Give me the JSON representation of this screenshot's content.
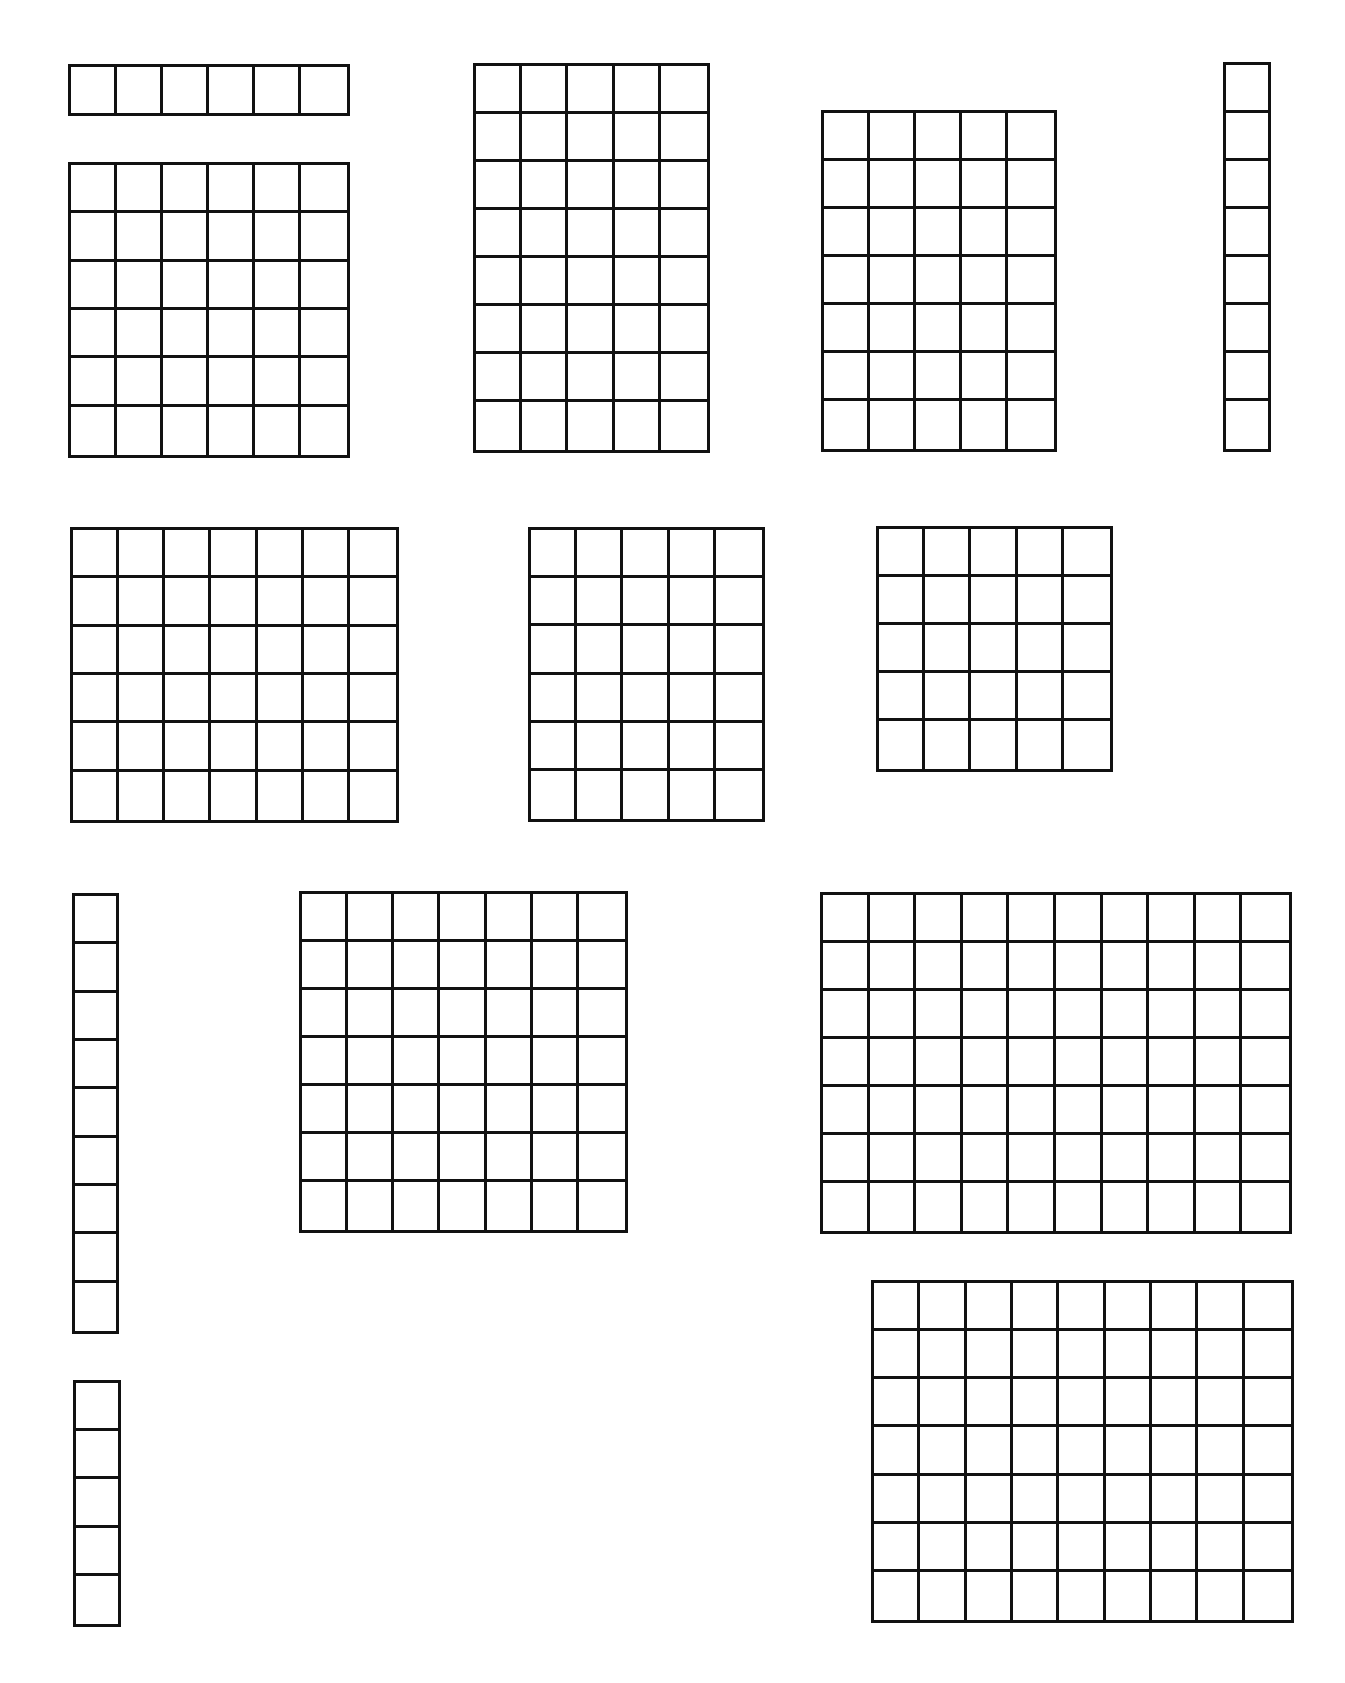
{
  "page": {
    "title": "",
    "background": "#ffffff",
    "line_color": "#111111",
    "line_width_px": 3,
    "cell_size_px": 48
  },
  "arrays": [
    {
      "id": "array-1",
      "rows": 1,
      "cols": 6,
      "x": 68,
      "y": 64,
      "w": 282,
      "h": 52
    },
    {
      "id": "array-2",
      "rows": 6,
      "cols": 6,
      "x": 68,
      "y": 162,
      "w": 282,
      "h": 296
    },
    {
      "id": "array-3",
      "rows": 8,
      "cols": 5,
      "x": 473,
      "y": 63,
      "w": 237,
      "h": 390
    },
    {
      "id": "array-4",
      "rows": 7,
      "cols": 5,
      "x": 821,
      "y": 110,
      "w": 236,
      "h": 342
    },
    {
      "id": "array-5",
      "rows": 8,
      "cols": 1,
      "x": 1223,
      "y": 62,
      "w": 48,
      "h": 390
    },
    {
      "id": "array-6",
      "rows": 6,
      "cols": 7,
      "x": 70,
      "y": 527,
      "w": 329,
      "h": 296
    },
    {
      "id": "array-7",
      "rows": 6,
      "cols": 5,
      "x": 528,
      "y": 527,
      "w": 237,
      "h": 295
    },
    {
      "id": "array-8",
      "rows": 5,
      "cols": 5,
      "x": 876,
      "y": 526,
      "w": 237,
      "h": 246
    },
    {
      "id": "array-9",
      "rows": 9,
      "cols": 1,
      "x": 72,
      "y": 893,
      "w": 47,
      "h": 441
    },
    {
      "id": "array-10",
      "rows": 7,
      "cols": 7,
      "x": 299,
      "y": 891,
      "w": 329,
      "h": 342
    },
    {
      "id": "array-11",
      "rows": 7,
      "cols": 10,
      "x": 820,
      "y": 892,
      "w": 472,
      "h": 342
    },
    {
      "id": "array-12",
      "rows": 5,
      "cols": 1,
      "x": 73,
      "y": 1380,
      "w": 48,
      "h": 247
    },
    {
      "id": "array-13",
      "rows": 7,
      "cols": 9,
      "x": 871,
      "y": 1280,
      "w": 423,
      "h": 343
    }
  ]
}
